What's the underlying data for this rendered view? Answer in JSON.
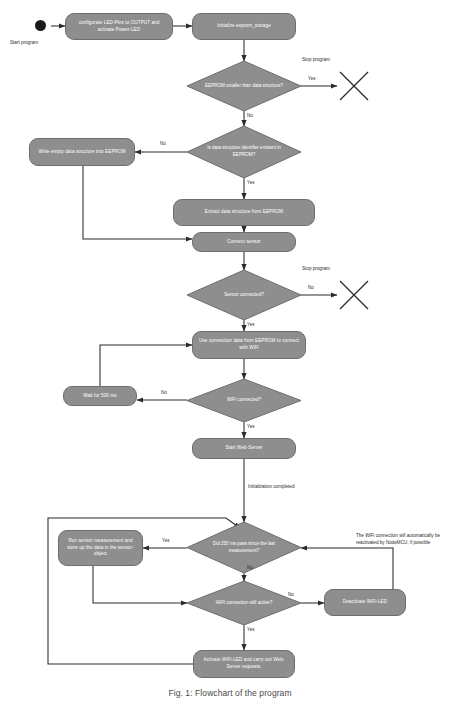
{
  "diagram": {
    "caption": "Fig. 1: Flowchart of the program",
    "colors": {
      "node_fill": "#8e8e8e",
      "node_stroke": "#6e6e6e",
      "node_text": "#ffffff",
      "line": "#2b2b2b",
      "start_dot": "#1a1a1a",
      "background": "#ffffff"
    },
    "labels": {
      "start_program": "Start program",
      "stop_program_1": "Stop program",
      "stop_program_2": "Stop program",
      "initialization_completed": "Initialization completed"
    },
    "note": "The WiFi connection will automatically be reactivated by NodeMCU, if possible",
    "nodes": [
      {
        "id": "start",
        "type": "start",
        "label": ""
      },
      {
        "id": "configure_led",
        "type": "action",
        "label": "configurate LED-Pins to OUTPUT and activate Power-LED"
      },
      {
        "id": "init_eeprom",
        "type": "action",
        "label": "Initialize eeprom_storage"
      },
      {
        "id": "eeprom_smaller",
        "type": "decision",
        "label": "EEPROM smaller than data structure?"
      },
      {
        "id": "stop_1",
        "type": "stop",
        "label": "Stop program"
      },
      {
        "id": "id_existent",
        "type": "decision",
        "label": "Is data structure identifier existent in EEPROM?"
      },
      {
        "id": "write_empty",
        "type": "action",
        "label": "Write empty data structure into EEPROM"
      },
      {
        "id": "extract_data",
        "type": "action",
        "label": "Extract data structure from EEPROM"
      },
      {
        "id": "connect_sensor",
        "type": "action",
        "label": "Connect sensor"
      },
      {
        "id": "sensor_connected",
        "type": "decision",
        "label": "Sensor connected?"
      },
      {
        "id": "stop_2",
        "type": "stop",
        "label": "Stop program"
      },
      {
        "id": "use_conn_data",
        "type": "action",
        "label": "Use connection data from EEPROM to connect with WiFi"
      },
      {
        "id": "wifi_connected",
        "type": "decision",
        "label": "WiFi connected?"
      },
      {
        "id": "wait_500",
        "type": "action",
        "label": "Wait for 500 ms"
      },
      {
        "id": "start_webserver",
        "type": "action",
        "label": "Start Web-Server"
      },
      {
        "id": "did_250ms",
        "type": "decision",
        "label": "Did 250 ms pass since the last measurement?"
      },
      {
        "id": "run_measurement",
        "type": "action",
        "label": "Run sensor measurement and store up the data in the sensor-object"
      },
      {
        "id": "wifi_still",
        "type": "decision",
        "label": "WiFi connection still active?"
      },
      {
        "id": "deactivate_led",
        "type": "action",
        "label": "Deactivate WiFi-LED"
      },
      {
        "id": "activate_led",
        "type": "action",
        "label": "Activate WiFi-LED and carry out Web-Server requests."
      }
    ],
    "edge_labels": {
      "eeprom_smaller_yes": "Yes",
      "eeprom_smaller_no": "No",
      "id_existent_no": "No",
      "id_existent_yes": "Yes",
      "sensor_connected_no": "No",
      "sensor_connected_yes": "Yes",
      "wifi_connected_no": "No",
      "wifi_connected_yes": "Yes",
      "did_250ms_yes": "Yes",
      "did_250ms_no": "No",
      "wifi_still_no": "No",
      "wifi_still_yes": "Yes"
    }
  }
}
